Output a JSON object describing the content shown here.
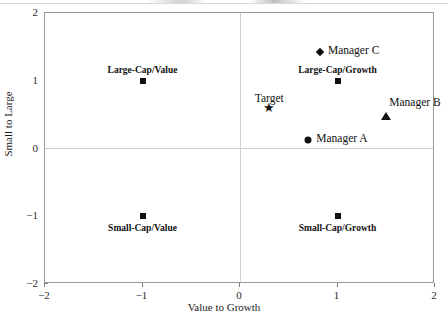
{
  "chart_data": {
    "type": "scatter",
    "title": "",
    "xlabel": "Value to Growth",
    "ylabel": "Small to Large",
    "xlim": [
      -2,
      2
    ],
    "ylim": [
      -2,
      2
    ],
    "xticks": [
      "-2",
      "-1",
      "0",
      "1",
      "2"
    ],
    "xtick_values": [
      -2,
      -1,
      0,
      1,
      2
    ],
    "yticks": [
      "-2",
      "-1",
      "0",
      "1",
      "2"
    ],
    "ytick_values": [
      -2,
      -1,
      0,
      1,
      2
    ],
    "grid": false,
    "zero_gridlines": true,
    "legend": "none",
    "points": [
      {
        "name": "Large-Cap/Value",
        "label": "Large-Cap/Value",
        "x": -1.0,
        "y": 1.0,
        "marker": "square",
        "label_pos": "above"
      },
      {
        "name": "Small-Cap/Value",
        "label": "Small-Cap/Value",
        "x": -1.0,
        "y": -1.0,
        "marker": "square",
        "label_pos": "below"
      },
      {
        "name": "Large-Cap/Growth",
        "label": "Large-Cap/Growth",
        "x": 1.0,
        "y": 1.0,
        "marker": "square",
        "label_pos": "above"
      },
      {
        "name": "Small-Cap/Growth",
        "label": "Small-Cap/Growth",
        "x": 1.0,
        "y": -1.0,
        "marker": "square",
        "label_pos": "below"
      },
      {
        "name": "Target",
        "label": "Target",
        "x": 0.3,
        "y": 0.6,
        "marker": "star",
        "label_pos": "above"
      },
      {
        "name": "Manager A",
        "label": "Manager A",
        "x": 0.7,
        "y": 0.12,
        "marker": "circle",
        "label_pos": "right"
      },
      {
        "name": "Manager B",
        "label": "Manager B",
        "x": 1.5,
        "y": 0.48,
        "marker": "triangle",
        "label_pos": "above-right"
      },
      {
        "name": "Manager C",
        "label": "Manager C",
        "x": 0.82,
        "y": 1.42,
        "marker": "diamond",
        "label_pos": "right"
      }
    ],
    "colors": {
      "marker": "#111111",
      "frame": "#9a9a9a",
      "gridline": "#d0d0d0",
      "background": "#ffffff",
      "text": "#1a1a1a"
    }
  }
}
